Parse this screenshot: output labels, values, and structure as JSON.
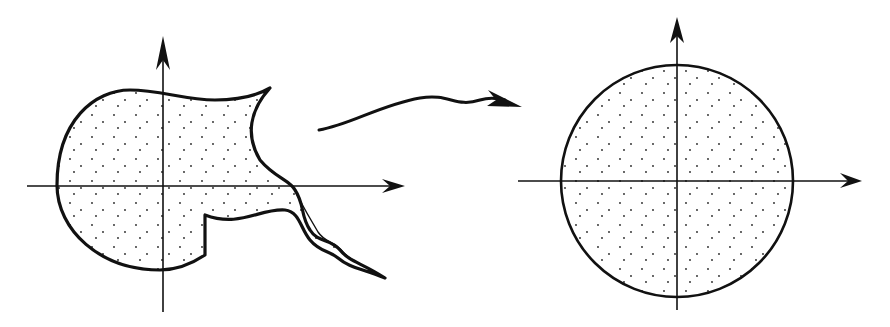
{
  "diagram": {
    "type": "conformal-mapping-illustration",
    "stroke_color": "#111111",
    "fill_color": "#ffffff",
    "stipple_color": "#222222",
    "left_panel": {
      "label": "",
      "description": "Irregular simply connected region with a cusp and a wiggly slit/tail, on coordinate axes",
      "origin": [
        163,
        186
      ],
      "x_axis": {
        "from": 27,
        "to": 405
      },
      "y_axis": {
        "from": 36,
        "to": 312
      }
    },
    "mapping_arrow": {
      "label": "",
      "description": "Wavy arrow indicating the conformal map from the region to the unit disk"
    },
    "right_panel": {
      "label": "",
      "description": "Unit disk, stippled, centered at origin of coordinate axes",
      "origin": [
        677,
        181
      ],
      "radius": 116,
      "x_axis": {
        "from": 518,
        "to": 862
      },
      "y_axis": {
        "from": 17,
        "to": 310
      }
    }
  }
}
